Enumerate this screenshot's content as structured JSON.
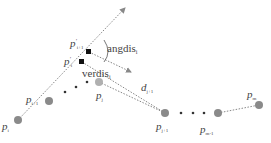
{
  "diagram": {
    "points": {
      "p_i": {
        "label": "p",
        "sub": "i",
        "x": 18,
        "y": 120
      },
      "p_i_plus_1": {
        "label": "p",
        "sub": "i+1",
        "x": 49,
        "y": 101
      },
      "p_j": {
        "label": "p",
        "sub": "j",
        "x": 99,
        "y": 82
      },
      "p_j_plus_1": {
        "label": "p",
        "sub": "j+1",
        "x": 165,
        "y": 113
      },
      "p_m_minus_1": {
        "label": "p",
        "sub": "m-1",
        "x": 218,
        "y": 113
      },
      "p_m": {
        "label": "p",
        "sub": "m",
        "x": 259,
        "y": 106
      },
      "p_i_prime": {
        "label": "p",
        "sub": "i",
        "sup": "'",
        "x": 82,
        "y": 62
      },
      "p_i1_prime": {
        "label": "p",
        "sub": "i+1",
        "sup": "'",
        "x": 89,
        "y": 52
      }
    },
    "annotations": {
      "angdis": {
        "text": "angdis",
        "sub": "i"
      },
      "verdis": {
        "text": "verdis",
        "sub": "i"
      },
      "d": {
        "text": "d",
        "sub": "j+1"
      }
    },
    "colors": {
      "point_fill": "#8a8a8a",
      "projected_point": "#111111",
      "dashed_line": "#888888"
    }
  }
}
